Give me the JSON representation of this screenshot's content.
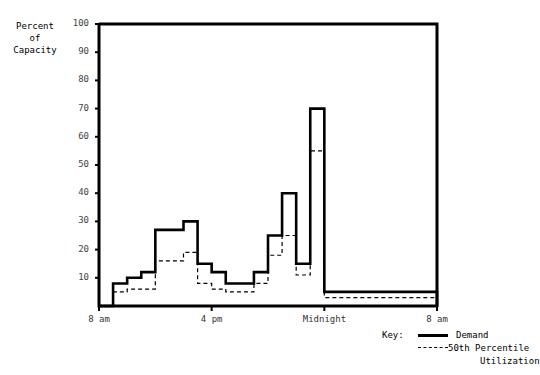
{
  "axis_title": {
    "line1": "Percent",
    "line2": "of",
    "line3": "Capacity"
  },
  "legend": {
    "key_label": "Key:",
    "demand_label": "Demand",
    "percentile_label": "50th Percentile",
    "percentile_label_cont": "Utilization"
  },
  "chart_data": {
    "type": "area",
    "title": "",
    "xlabel": "",
    "ylabel": "Percent of Capacity",
    "ylim": [
      0,
      100
    ],
    "xlim": [
      8,
      32
    ],
    "grid": false,
    "legend_position": "bottom-right",
    "yticks": [
      10,
      20,
      30,
      40,
      50,
      60,
      70,
      80,
      90,
      100
    ],
    "ytick_labels": [
      "10",
      "20",
      "30",
      "40",
      "50",
      "60",
      "70",
      "80",
      "90",
      "100"
    ],
    "xticks": [
      8,
      16,
      24,
      32
    ],
    "xtick_labels": [
      "8 am",
      "4 pm",
      "Midnight",
      "8 am"
    ],
    "step_edges": [
      8,
      9,
      10,
      11,
      12,
      13,
      14,
      15,
      16,
      17,
      18,
      19,
      20,
      21,
      22,
      23,
      24,
      32
    ],
    "series": [
      {
        "name": "Demand",
        "style": "solid",
        "values": [
          0,
          8,
          10,
          12,
          27,
          27,
          30,
          15,
          12,
          8,
          8,
          12,
          25,
          40,
          15,
          70,
          5,
          0
        ]
      },
      {
        "name": "50th Percentile Utilization",
        "style": "dashed",
        "values": [
          0,
          5,
          6,
          6,
          16,
          16,
          19,
          8,
          6,
          5,
          5,
          8,
          18,
          25,
          11,
          55,
          3,
          0
        ]
      }
    ]
  }
}
